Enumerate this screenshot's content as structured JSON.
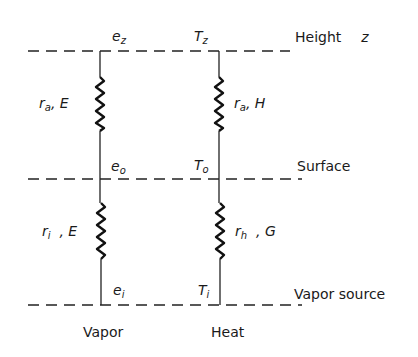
{
  "levels": {
    "top": {
      "label": "Height",
      "symbol": "z"
    },
    "middle": {
      "label": "Surface"
    },
    "bottom": {
      "label": "Vapor source"
    }
  },
  "columns": {
    "vapor": {
      "label": "Vapor",
      "nodes": {
        "top": {
          "var": "e",
          "sub": "z"
        },
        "middle": {
          "var": "e",
          "sub": "o"
        },
        "bottom": {
          "var": "e",
          "sub": "i"
        }
      },
      "resistors": {
        "upper": {
          "r": "r",
          "r_sub": "a",
          "flux": "E"
        },
        "lower": {
          "r": "r",
          "r_sub": "i",
          "flux": "E"
        }
      }
    },
    "heat": {
      "label": "Heat",
      "nodes": {
        "top": {
          "var": "T",
          "sub": "z"
        },
        "middle": {
          "var": "T",
          "sub": "o"
        },
        "bottom": {
          "var": "T",
          "sub": "i"
        }
      },
      "resistors": {
        "upper": {
          "r": "r",
          "r_sub": "a",
          "flux": "H"
        },
        "lower": {
          "r": "r",
          "r_sub": "h",
          "flux": "G"
        }
      }
    }
  },
  "separator": ","
}
